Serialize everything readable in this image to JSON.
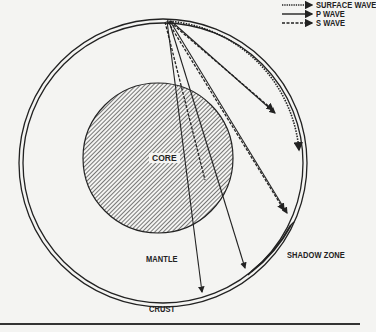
{
  "figure": {
    "fragment_text": "",
    "legend": [
      {
        "label": "SURFACE WAVE",
        "style": "dotted"
      },
      {
        "label": "P WAVE",
        "style": "solid"
      },
      {
        "label": "S WAVE",
        "style": "dashed"
      }
    ],
    "labels": {
      "core": "CORE",
      "mantle": "MANTLE",
      "crust": "CRUST",
      "shadow_zone": "SHADOW ZONE"
    },
    "colors": {
      "ink": "#222222",
      "paper": "#f4f4f2"
    }
  }
}
